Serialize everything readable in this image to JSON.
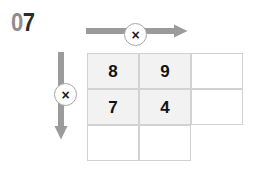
{
  "page": {
    "width": 261,
    "height": 177,
    "background_color": "#ffffff"
  },
  "problem_number": {
    "prefix": "0",
    "digit": "7",
    "full_label": "07",
    "prefix_color": "#8d8d8d",
    "digit_color": "#2b2b2b"
  },
  "operators": {
    "top": {
      "symbol": "×",
      "name": "multiply",
      "direction": "right"
    },
    "left": {
      "symbol": "×",
      "name": "multiply",
      "direction": "down"
    }
  },
  "arrows": {
    "horizontal": {
      "direction": "right",
      "color": "#9b9b9b"
    },
    "vertical": {
      "direction": "down",
      "color": "#9b9b9b"
    }
  },
  "grid": {
    "rows": 3,
    "columns": 3,
    "cell_width": 52,
    "cell_height": 36,
    "border_color": "#d2d2d2",
    "shaded_color": "#f2f2f2",
    "cells": [
      {
        "row": 0,
        "col": 0,
        "value": "8",
        "shaded": true,
        "present": true
      },
      {
        "row": 0,
        "col": 1,
        "value": "9",
        "shaded": true,
        "present": true
      },
      {
        "row": 0,
        "col": 2,
        "value": "",
        "shaded": false,
        "present": true
      },
      {
        "row": 1,
        "col": 0,
        "value": "7",
        "shaded": true,
        "present": true
      },
      {
        "row": 1,
        "col": 1,
        "value": "4",
        "shaded": true,
        "present": true
      },
      {
        "row": 1,
        "col": 2,
        "value": "",
        "shaded": false,
        "present": true
      },
      {
        "row": 2,
        "col": 0,
        "value": "",
        "shaded": false,
        "present": true
      },
      {
        "row": 2,
        "col": 1,
        "value": "",
        "shaded": false,
        "present": true
      },
      {
        "row": 2,
        "col": 2,
        "value": "",
        "shaded": false,
        "present": false
      }
    ]
  }
}
